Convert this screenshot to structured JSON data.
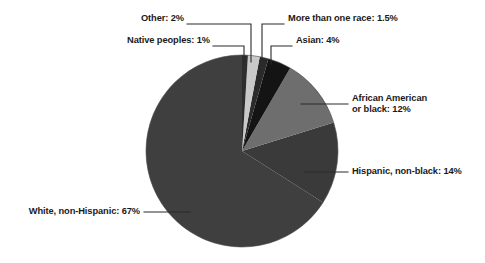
{
  "chart_data": {
    "type": "pie",
    "title": "",
    "xlabel": "",
    "ylabel": "",
    "legend_position": "callout-labels",
    "grid": false,
    "categories": [
      "White, non-Hispanic",
      "Hispanic, non-black",
      "African American or black",
      "Asian",
      "More than one race",
      "Other",
      "Native peoples"
    ],
    "values": [
      67,
      14,
      12,
      4,
      1.5,
      2,
      1
    ],
    "value_labels": [
      "67%",
      "14%",
      "12%",
      "4%",
      "1.5%",
      "2%",
      "1%"
    ],
    "colors": [
      "#3f3f3f",
      "#3a3a3a",
      "#6e6e6e",
      "#141414",
      "#2a2a2a",
      "#c9c9c9",
      "#2e2e2e"
    ],
    "slices": [
      {
        "name": "Other",
        "percent": 2,
        "label": "Other: 2%",
        "color": "#c9c9c9"
      },
      {
        "name": "More than one race",
        "percent": 1.5,
        "label": "More than one race: 1.5%",
        "color": "#2a2a2a"
      },
      {
        "name": "Native peoples",
        "percent": 1,
        "label": "Native peoples: 1%",
        "color": "#2e2e2e"
      },
      {
        "name": "Asian",
        "percent": 4,
        "label": "Asian: 4%",
        "color": "#141414"
      },
      {
        "name": "African American or black",
        "percent": 12,
        "label_line1": "African American",
        "label_line2": "or black: 12%",
        "color": "#6e6e6e"
      },
      {
        "name": "Hispanic, non-black",
        "percent": 14,
        "label": "Hispanic, non-black: 14%",
        "color": "#3a3a3a"
      },
      {
        "name": "White, non-Hispanic",
        "percent": 67,
        "label": "White, non-Hispanic: 67%",
        "color": "#3f3f3f"
      }
    ]
  },
  "labels": {
    "other": "Other: 2%",
    "more_than_one_race": "More than one race: 1.5%",
    "native_peoples": "Native peoples: 1%",
    "asian": "Asian: 4%",
    "african_american_line1": "African American",
    "african_american_line2": "or black: 12%",
    "hispanic": "Hispanic, non-black: 14%",
    "white": "White, non-Hispanic: 67%"
  },
  "style": {
    "background": "#ffffff",
    "leader_line_color": "#2b2b2b",
    "text_color": "#1a1a1a"
  }
}
